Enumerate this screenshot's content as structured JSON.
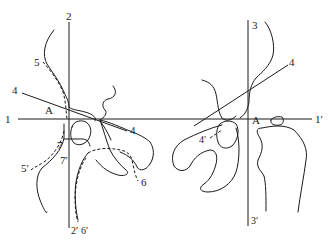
{
  "figure": {
    "labels": {
      "line1_left": "1",
      "line1_right": "1′",
      "line2_top": "2",
      "line2_bottom": "2′",
      "line3_top": "3",
      "line3_bottom": "3′",
      "line4_left_start": "4",
      "line4_left_end": "4",
      "line4_right_end": "4",
      "line4_prime": "4′",
      "point_a_left": "A",
      "point_a_right": "A",
      "curve5": "5",
      "curve5_prime": "5′",
      "curve6": "6",
      "curve6_prime": "6′",
      "curve7": "7",
      "curve7_prime": "7′"
    },
    "colors": {
      "ink": "#1a1a1a",
      "background": "#ffffff"
    }
  }
}
